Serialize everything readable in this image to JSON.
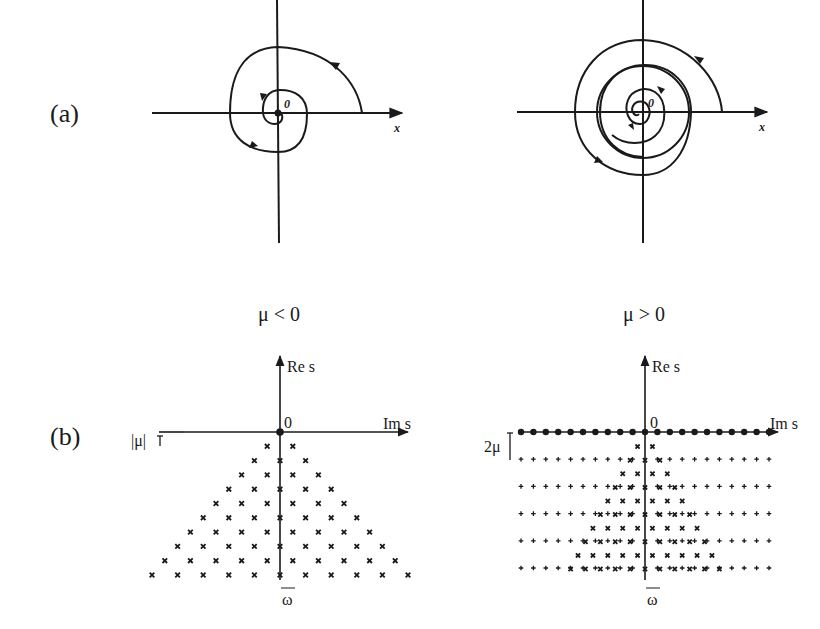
{
  "figure": {
    "panel_a": {
      "label": "(a)",
      "left": {
        "origin_label": "0",
        "x_axis_label": "x",
        "description": "trajectory spiralling into stable focus at origin"
      },
      "right": {
        "origin_label": "0",
        "x_axis_label": "x",
        "description": "trajectories from inside and outside approaching a stable limit cycle"
      }
    },
    "conditions": {
      "left": "μ < 0",
      "right": "μ > 0"
    },
    "panel_b": {
      "label": "(b)",
      "left": {
        "y_axis_label": "Re s",
        "x_axis_label": "Im s",
        "origin_label": "0",
        "spacing_label": "|μ|",
        "frequency_label": "ω",
        "marker": "x",
        "rows": 10
      },
      "right": {
        "y_axis_label": "Re s",
        "x_axis_label": "Im s",
        "origin_label": "0",
        "spacing_label": "2μ",
        "frequency_label": "ω",
        "markers": [
          "dot",
          "plus",
          "x"
        ],
        "rows": 5
      }
    }
  }
}
